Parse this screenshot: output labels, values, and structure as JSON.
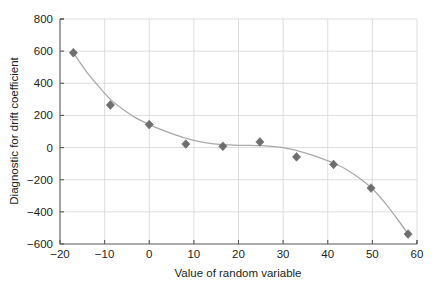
{
  "chart_data": {
    "type": "scatter",
    "title": "",
    "xlabel": "Value of random variable",
    "ylabel": "Diagnostic for drift coefficient",
    "xlim": [
      -20,
      60
    ],
    "ylim": [
      -600,
      800
    ],
    "xticks": [
      -20,
      -10,
      0,
      10,
      20,
      30,
      40,
      50,
      60
    ],
    "xtick_labels": [
      "−20",
      "−10",
      "0",
      "10",
      "20",
      "30",
      "40",
      "50",
      "60"
    ],
    "yticks": [
      -600,
      -400,
      -200,
      0,
      200,
      400,
      600,
      800
    ],
    "ytick_labels": [
      "−600",
      "−400",
      "−200",
      "0",
      "200",
      "400",
      "600",
      "800"
    ],
    "grid": true,
    "legend": "none",
    "marker_shape": "diamond",
    "marker_color": "#6e6e70",
    "line_color": "#a9a9ab",
    "axis_color": "#58585a",
    "grid_color": "#d6d6d8",
    "series": [
      {
        "name": "Diagnostic for drift coefficient",
        "x": [
          -17.0,
          -8.7,
          0.0,
          8.2,
          16.5,
          24.8,
          33.0,
          41.3,
          49.7,
          58.0
        ],
        "y": [
          590,
          265,
          143,
          22,
          8,
          35,
          -58,
          -105,
          -252,
          -538
        ]
      }
    ],
    "fit_curve": {
      "name": "smoothed trend line",
      "x": [
        -17.0,
        -14.0,
        -11.0,
        -8.7,
        -6.0,
        -3.0,
        0.0,
        3.0,
        6.0,
        8.2,
        11.0,
        14.0,
        16.5,
        20.0,
        24.8,
        28.0,
        30.0,
        33.0,
        36.0,
        41.3,
        45.0,
        49.7,
        53.0,
        56.0,
        58.0
      ],
      "y": [
        590,
        470,
        370,
        300,
        240,
        185,
        143,
        108,
        78,
        58,
        38,
        24,
        18,
        14,
        12,
        6,
        0,
        -18,
        -42,
        -96,
        -150,
        -248,
        -350,
        -460,
        -538
      ]
    }
  },
  "figure": {
    "top_artifact_text": ""
  }
}
